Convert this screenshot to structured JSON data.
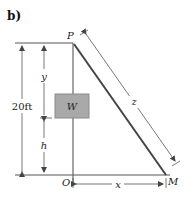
{
  "figure": {
    "panel_label": "b)",
    "points": {
      "P": "P",
      "O": "O",
      "M": "M"
    },
    "block_label": "W",
    "dimensions": {
      "total_height": "20ft",
      "upper": "y",
      "lower": "h",
      "horizontal": "x",
      "hypotenuse": "z"
    },
    "colors": {
      "line": "#555555",
      "block_fill": "#a9a9a9",
      "block_stroke": "#8a8a8a",
      "text": "#222222"
    }
  }
}
